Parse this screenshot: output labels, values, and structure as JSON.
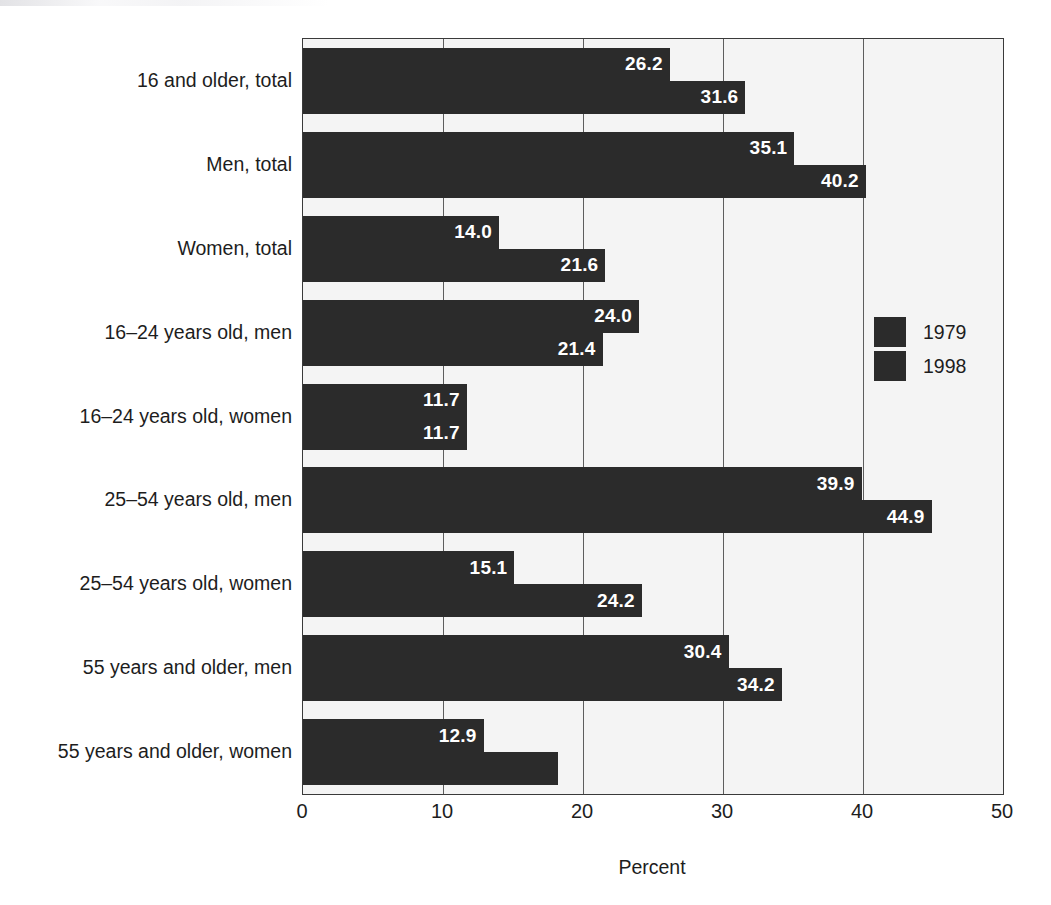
{
  "chart_data": {
    "type": "bar",
    "orientation": "horizontal",
    "title": "",
    "xlabel": "Percent",
    "ylabel": "",
    "xlim": [
      0,
      50
    ],
    "xticks": [
      "0",
      "10",
      "20",
      "30",
      "40",
      "50"
    ],
    "xtick_values": [
      0,
      10,
      20,
      30,
      40,
      50
    ],
    "grid": "vertical",
    "legend_position": "right",
    "categories": [
      "16 and older, total",
      "Men, total",
      "Women, total",
      "16–24 years old, men",
      "16–24 years old, women",
      "25–54 years old, men",
      "25–54 years old, women",
      "55 years and older, men",
      "55 years and older, women"
    ],
    "series": [
      {
        "name": "1979",
        "color": "#2b2b2b",
        "values": [
          26.2,
          35.1,
          14.0,
          24.0,
          11.7,
          39.9,
          15.1,
          30.4,
          12.9
        ],
        "labels": [
          "26.2",
          "35.1",
          "14.0",
          "24.0",
          "11.7",
          "39.9",
          "15.1",
          "30.4",
          "12.9"
        ]
      },
      {
        "name": "1998",
        "color": "#2b2b2b",
        "values": [
          31.6,
          40.2,
          21.6,
          21.4,
          11.7,
          44.9,
          24.2,
          34.2,
          18.2
        ],
        "labels": [
          "31.6",
          "40.2",
          "21.6",
          "21.4",
          "11.7",
          "44.9",
          "24.2",
          "34.2",
          ""
        ]
      }
    ]
  },
  "colors": {
    "bar": "#2b2b2b",
    "plot_background": "#f4f4f4",
    "plot_border": "#3a3a3a",
    "gridline": "#5d5d5d",
    "value_label": "#ffffff",
    "text": "#1d1d1d"
  }
}
